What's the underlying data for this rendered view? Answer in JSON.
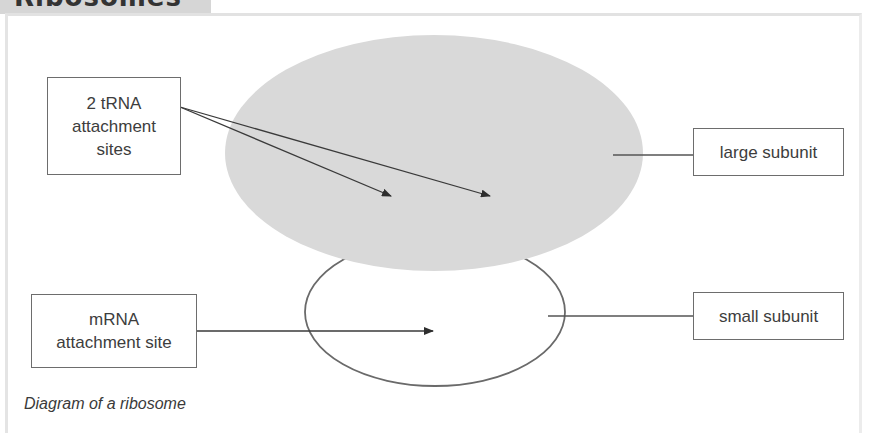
{
  "header": {
    "title": "Ribosomes"
  },
  "diagram": {
    "title": "Diagram of a ribosome",
    "colors": {
      "large_subunit_fill": "#d9d9d9",
      "outline": "#6a6a6a",
      "box_border": "#6d6d6d"
    },
    "labels": {
      "trna": "2 tRNA attachment sites",
      "trna_line1": "2 tRNA",
      "trna_line2": "attachment",
      "trna_line3": "sites",
      "mrna_line1": "mRNA",
      "mrna_line2": "attachment site",
      "large_subunit": "large subunit",
      "small_subunit": "small subunit"
    },
    "nodes": [
      {
        "id": "large-subunit",
        "shape": "ellipse",
        "filled": true
      },
      {
        "id": "small-subunit",
        "shape": "ellipse",
        "filled": false
      }
    ],
    "edges": [
      {
        "from": "trna-label",
        "to": "large-subunit",
        "count": 2,
        "arrow": true
      },
      {
        "from": "mrna-label",
        "to": "small-subunit",
        "arrow": true
      },
      {
        "from": "large-subunit",
        "to": "large-subunit-label",
        "arrow": false
      },
      {
        "from": "small-subunit",
        "to": "small-subunit-label",
        "arrow": false
      }
    ]
  }
}
